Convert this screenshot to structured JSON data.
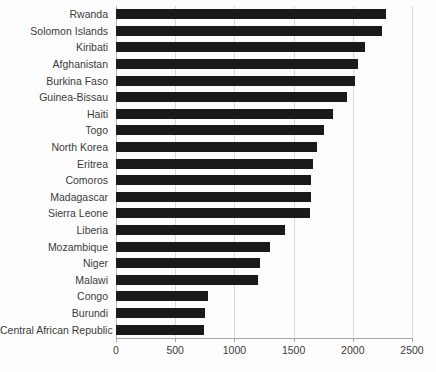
{
  "chart_data": {
    "type": "bar",
    "orientation": "horizontal",
    "title": "",
    "subtitle": "",
    "xlabel": "",
    "ylabel": "",
    "xlim": [
      0,
      2500
    ],
    "xticks": [
      0,
      500,
      1000,
      1500,
      2000,
      2500
    ],
    "xtick_labels": [
      "0",
      "500",
      "1000",
      "1500",
      "2000",
      "2500"
    ],
    "grid": true,
    "grid_axis": "x",
    "legend": false,
    "legend_position": "none",
    "bar_color": "#1a1a1a",
    "categories": [
      "Rwanda",
      "Solomon Islands",
      "Kiribati",
      "Afghanistan",
      "Burkina Faso",
      "Guinea-Bissau",
      "Haiti",
      "Togo",
      "North Korea",
      "Eritrea",
      "Comoros",
      "Madagascar",
      "Sierra Leone",
      "Liberia",
      "Mozambique",
      "Niger",
      "Malawi",
      "Congo",
      "Burundi",
      "Central African Republic"
    ],
    "values": [
      2280,
      2250,
      2100,
      2040,
      2020,
      1950,
      1830,
      1760,
      1700,
      1660,
      1650,
      1650,
      1640,
      1430,
      1300,
      1220,
      1200,
      780,
      750,
      740
    ]
  }
}
